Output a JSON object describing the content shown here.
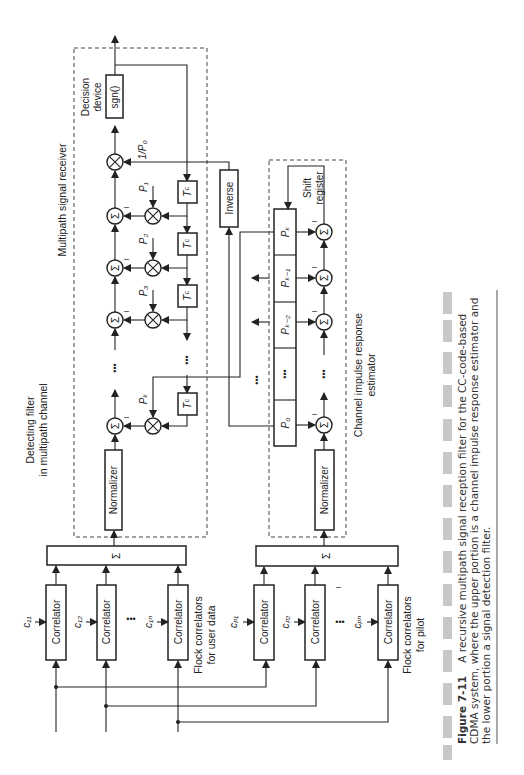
{
  "diagram": {
    "upper_group": {
      "box_label_line1": "Detecting filter",
      "box_label_line2": "in multipath channel",
      "section_label": "Multipath signal receiver",
      "decision_label_line1": "Decision",
      "decision_label_line2": "device",
      "sgn_label": "sgn()",
      "scale_label": "1/P₀",
      "inverse_label": "Inverse",
      "normalizer_label": "Normalizer",
      "sum_symbol": "Σ",
      "minus": "–",
      "taps": [
        {
          "label": "P₁",
          "delay": "Tᶜ"
        },
        {
          "label": "P₂",
          "delay": "Tᶜ"
        },
        {
          "label": "P₃",
          "delay": "Tᶜ"
        },
        {
          "label": "Pₖ",
          "delay": "Tᶜ"
        }
      ],
      "ellipsis": "•••",
      "sum_bar_label": "Σ",
      "correlator_label": "Correlator",
      "codes": [
        "c₁₁",
        "c₁₂",
        "c₁ₙ"
      ],
      "flock_label_line1": "Flock correlators",
      "flock_label_line2": "for user data"
    },
    "lower_group": {
      "section_label_line1": "Channel impulse response",
      "section_label_line2": "estimator",
      "shift_label_line1": "Shift",
      "shift_label_line2": "register",
      "cells": [
        "Pₖ",
        "Pₖ₋₁",
        "Pₖ₋₂",
        "•••",
        "P₀"
      ],
      "normalizer_label": "Normalizer",
      "sum_symbol": "Σ",
      "sum_bar_label": "Σ",
      "correlator_label": "Correlator",
      "codes": [
        "cₚ₁",
        "cₚ₂",
        "cₚₙ"
      ],
      "flock_label_line1": "Flock correlators",
      "flock_label_line2": "for pilot"
    }
  },
  "caption": {
    "figure_number": "Figure 7-11",
    "line1": "A recursive multipath signal reception filter for the CC-code-based",
    "line2": "CDMA system, where the upper portion is a channel impulse response estimator and",
    "line3": "the lower portion a signal detection filter."
  }
}
